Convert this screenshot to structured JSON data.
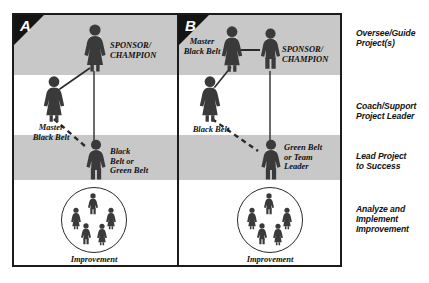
{
  "diagram": {
    "panels": [
      {
        "id": "A",
        "tag": "A",
        "roles": [
          {
            "key": "sponsor",
            "label": "SPONSOR/\nCHAMPION",
            "gender": "female"
          },
          {
            "key": "mbb",
            "label": "Master\nBlack Belt",
            "gender": "female"
          },
          {
            "key": "belt",
            "label": "Black\nBelt or\nGreen Belt",
            "gender": "male"
          },
          {
            "key": "team",
            "label": "Improvement\nTeam",
            "gender": "group"
          }
        ]
      },
      {
        "id": "B",
        "tag": "B",
        "roles": [
          {
            "key": "mbb",
            "label": "Master\nBlack Belt",
            "gender": "female"
          },
          {
            "key": "sponsor",
            "label": "SPONSOR/\nCHAMPION",
            "gender": "male"
          },
          {
            "key": "bb",
            "label": "Black Belt",
            "gender": "female"
          },
          {
            "key": "belt",
            "label": "Green Belt\nor Team\nLeader",
            "gender": "male"
          },
          {
            "key": "team",
            "label": "Improvement\nTeam",
            "gender": "group"
          }
        ]
      }
    ],
    "phases": [
      {
        "key": "phase-1",
        "text": "Oversee/Guide\nProject(s)"
      },
      {
        "key": "phase-2",
        "text": "Coach/Support\nProject Leader"
      },
      {
        "key": "phase-3",
        "text": "Lead Project\nto Success"
      },
      {
        "key": "phase-4",
        "text": "Analyze and\nImplement\nImprovement"
      }
    ],
    "colors": {
      "band": "#c8c8c8",
      "frame": "#1b1b1b",
      "figure": "#3a3a3a",
      "text": "#111111",
      "corner": "#141414",
      "background": "#ffffff"
    }
  }
}
